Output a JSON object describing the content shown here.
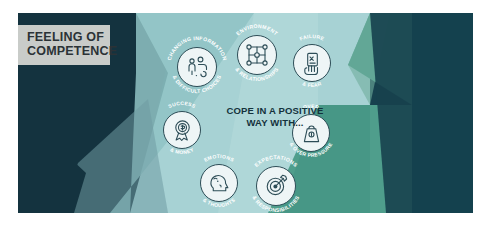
{
  "title": {
    "line1": "FEELING OF",
    "line2": "COMPETENCE"
  },
  "center_caption": {
    "line1": "COPE IN A POSITIVE",
    "line2": "WAY WITH..."
  },
  "nodes": [
    {
      "id": "changing-information",
      "top_label": "CHANGING INFORMATION",
      "bottom_label": "& DIFFICULT CHOICES",
      "icon": "person-question-icon"
    },
    {
      "id": "environment-relationships",
      "top_label": "ENVIRONMENT",
      "bottom_label": "& RELATIONSHIPS",
      "icon": "network-nodes-icon"
    },
    {
      "id": "failure-fear",
      "top_label": "FAILURE",
      "bottom_label": "& FEAR",
      "icon": "hand-holding-test-icon"
    },
    {
      "id": "success-money",
      "top_label": "SUCCESS",
      "bottom_label": "& MONEY",
      "icon": "award-ribbon-icon"
    },
    {
      "id": "over-pressure",
      "top_label": "OVER",
      "bottom_label": "& OVER PRESSURE",
      "icon": "weight-icon"
    },
    {
      "id": "emotions-thoughts",
      "top_label": "EMOTIONS",
      "bottom_label": "& THOUGHTS",
      "icon": "head-profile-icon"
    },
    {
      "id": "expectations-responsibilities",
      "top_label": "EXPECTATIONS",
      "bottom_label": "& RESPONSIBILITIES",
      "icon": "target-bullseye-icon"
    }
  ],
  "colors": {
    "page_background": "#ffffff",
    "dark_teal": "#17414e",
    "deep_navy_teal": "#14333f",
    "pale_aqua": "#a8d4d6",
    "mid_teal": "#7fb9b8",
    "green_teal": "#4f9e8c",
    "slate_teal": "#5f8f95",
    "title_plaque": "#c9ccc9",
    "title_text": "#2b3236",
    "caption_text": "#14323c",
    "icon_disc": "#eef5f6",
    "icon_stroke": "#2d4d57"
  }
}
